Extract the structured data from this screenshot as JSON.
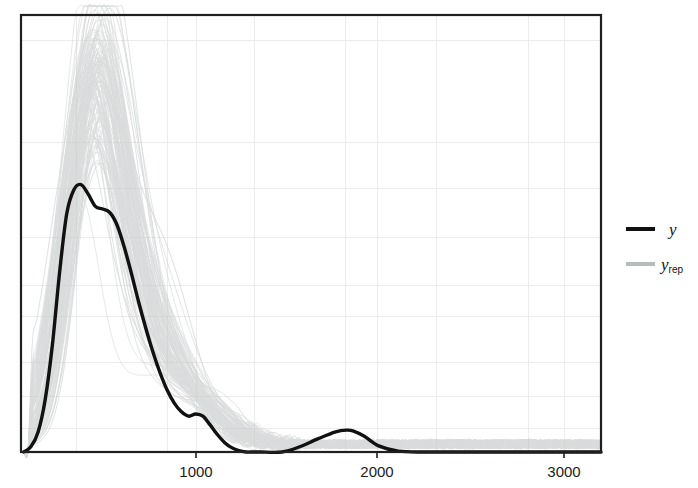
{
  "figure": {
    "background_color": "#ffffff",
    "frame_color": "#1a1a1a",
    "grid_color": "#eeeeea",
    "plot_area": {
      "x": 21,
      "y": 15,
      "width": 580,
      "height": 437
    }
  },
  "axes": {
    "x_ticks": [
      {
        "label": "1000",
        "value": 1000,
        "px": 196
      },
      {
        "label": "2000",
        "value": 2000,
        "px": 377
      },
      {
        "label": "3000",
        "value": 3000,
        "px": 564
      }
    ],
    "x_label": "",
    "y_label": "",
    "y_ticks": [],
    "x_range": [
      -55,
      3180
    ],
    "y_range": [
      0,
      1
    ],
    "grid": true,
    "y_axis_visible": false
  },
  "legend": {
    "position": "right",
    "entries": [
      {
        "key": "y",
        "label": "y",
        "sub": "",
        "color": "#111111",
        "linewidth": 3.4
      },
      {
        "key": "yrep",
        "label": "y",
        "sub": "rep",
        "color": "#b9bcbd",
        "linewidth": 3.4
      }
    ]
  },
  "chart_data": {
    "type": "line",
    "title": "",
    "subtitle": "",
    "xlabel": "",
    "ylabel": "",
    "xlim": [
      -55,
      3180
    ],
    "ylim": [
      0,
      1.0
    ],
    "grid": true,
    "legend_position": "right",
    "series": [
      {
        "name": "y",
        "style": "solid",
        "color": "#111111",
        "linewidth": 3.4,
        "x": [
          -40,
          0,
          40,
          80,
          120,
          160,
          200,
          240,
          280,
          320,
          360,
          400,
          440,
          480,
          520,
          560,
          600,
          640,
          680,
          720,
          760,
          800,
          840,
          880,
          920,
          960,
          1000,
          1040,
          1080,
          1120,
          1160,
          1200,
          1240,
          1280,
          1400,
          1500,
          1600,
          1700,
          1760,
          1800,
          1860,
          1940,
          2050,
          2200,
          2400,
          2600,
          2800,
          3000,
          3180
        ],
        "y": [
          0.0,
          0.012,
          0.045,
          0.12,
          0.245,
          0.41,
          0.545,
          0.6,
          0.612,
          0.59,
          0.562,
          0.556,
          0.548,
          0.52,
          0.47,
          0.41,
          0.345,
          0.285,
          0.23,
          0.182,
          0.142,
          0.112,
          0.092,
          0.082,
          0.087,
          0.082,
          0.062,
          0.04,
          0.022,
          0.01,
          0.003,
          0.0,
          0.0,
          0.0,
          0.0,
          0.012,
          0.03,
          0.046,
          0.05,
          0.048,
          0.036,
          0.014,
          0.002,
          0.0,
          0.0,
          0.0,
          0.0,
          0.0,
          0.0
        ]
      },
      {
        "name": "y_rep",
        "style": "solid",
        "color": "#c3c6c7",
        "linewidth": 0.6,
        "count": 120,
        "envelope_note": "Light grey replicate densities; peak heights vary ~0.55 to 1.0 near x=300-450, tight tail noise beyond x=1300."
      }
    ],
    "annotations": []
  }
}
